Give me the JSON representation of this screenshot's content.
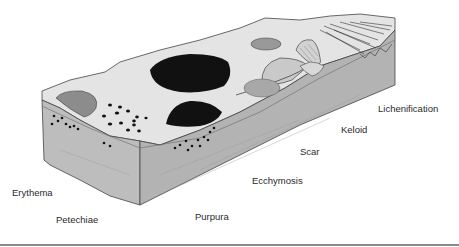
{
  "figure": {
    "colors": {
      "surface": "#e6e6e6",
      "front_face": "#bdbdbd",
      "side_face": "#b0b0b0",
      "erythema": "#8c8c8c",
      "purpura": "#111111",
      "ecchymosis": "#111111",
      "bottom_rule": "#8a8a8a"
    },
    "labels": [
      {
        "id": "erythema",
        "text": "Erythema"
      },
      {
        "id": "petechiae",
        "text": "Petechiae"
      },
      {
        "id": "purpura",
        "text": "Purpura"
      },
      {
        "id": "ecchymosis",
        "text": "Ecchymosis"
      },
      {
        "id": "scar",
        "text": "Scar"
      },
      {
        "id": "keloid",
        "text": "Keloid"
      },
      {
        "id": "lichenification",
        "text": "Lichenification"
      }
    ]
  }
}
